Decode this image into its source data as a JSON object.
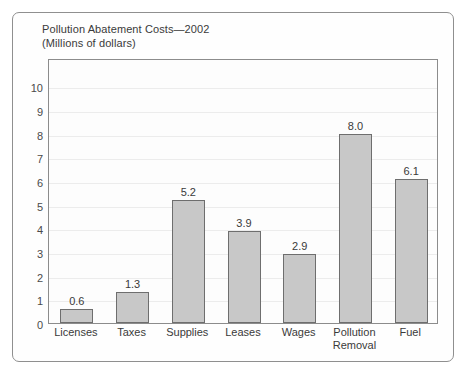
{
  "figure": {
    "title": "Pollution Abatement Costs—2002",
    "subtitle": "(Millions of dollars)"
  },
  "chart_data": {
    "type": "bar",
    "title": "Pollution Abatement Costs—2002",
    "subtitle": "(Millions of dollars)",
    "xlabel": "",
    "ylabel": "",
    "ylim": [
      0,
      10
    ],
    "yticks": [
      0,
      1,
      2,
      3,
      4,
      5,
      6,
      7,
      8,
      9,
      10
    ],
    "ytick_labels": [
      "0",
      "1",
      "2",
      "3",
      "4",
      "5",
      "6",
      "7",
      "8",
      "9",
      "10"
    ],
    "grid": true,
    "legend": false,
    "categories": [
      "Licenses",
      "Taxes",
      "Supplies",
      "Leases",
      "Wages",
      "Pollution Removal",
      "Fuel"
    ],
    "category_labels": [
      [
        "Licenses"
      ],
      [
        "Taxes"
      ],
      [
        "Supplies"
      ],
      [
        "Leases"
      ],
      [
        "Wages"
      ],
      [
        "Pollution",
        "Removal"
      ],
      [
        "Fuel"
      ]
    ],
    "values": [
      0.6,
      1.3,
      5.2,
      3.9,
      2.9,
      8.0,
      6.1
    ],
    "value_labels": [
      "0.6",
      "1.3",
      "5.2",
      "3.9",
      "2.9",
      "8.0",
      "6.1"
    ],
    "colors": {
      "bar_fill": "#c8c8c8",
      "bar_border": "#6e6e6e",
      "frame": "#8c8c8c",
      "grid": "#ececec",
      "text": "#3a3a3a",
      "background": "#fdfdfd"
    }
  }
}
